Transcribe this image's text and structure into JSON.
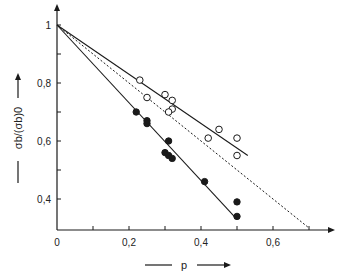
{
  "chart_data": {
    "type": "scatter",
    "title": "",
    "xlabel": "p",
    "ylabel": "σb/(σb)0",
    "xlim": [
      0,
      0.75
    ],
    "ylim": [
      0.3,
      1.05
    ],
    "x_ticks": [
      0,
      0.1,
      0.2,
      0.3,
      0.4,
      0.5,
      0.6,
      0.7
    ],
    "x_tick_labels": [
      {
        "value": 0,
        "label": "0"
      },
      {
        "value": 0.2,
        "label": "0,2"
      },
      {
        "value": 0.4,
        "label": "0,4"
      },
      {
        "value": 0.6,
        "label": "0,6"
      }
    ],
    "y_ticks": [
      0.4,
      0.5,
      0.6,
      0.7,
      0.8,
      0.9,
      1.0
    ],
    "y_tick_labels": [
      {
        "value": 1.0,
        "label": "1"
      },
      {
        "value": 0.8,
        "label": "0,8"
      },
      {
        "value": 0.6,
        "label": "0,6"
      },
      {
        "value": 0.4,
        "label": "0,4"
      }
    ],
    "grid": false,
    "legend": null,
    "series": [
      {
        "name": "open circles",
        "marker": "open-circle",
        "points": [
          [
            0.23,
            0.81
          ],
          [
            0.25,
            0.75
          ],
          [
            0.3,
            0.76
          ],
          [
            0.32,
            0.74
          ],
          [
            0.32,
            0.71
          ],
          [
            0.31,
            0.7
          ],
          [
            0.45,
            0.64
          ],
          [
            0.42,
            0.61
          ],
          [
            0.5,
            0.61
          ],
          [
            0.5,
            0.55
          ]
        ]
      },
      {
        "name": "filled circles",
        "marker": "filled-circle",
        "points": [
          [
            0.22,
            0.7
          ],
          [
            0.25,
            0.66
          ],
          [
            0.25,
            0.67
          ],
          [
            0.31,
            0.6
          ],
          [
            0.3,
            0.56
          ],
          [
            0.31,
            0.55
          ],
          [
            0.32,
            0.54
          ],
          [
            0.41,
            0.46
          ],
          [
            0.5,
            0.39
          ],
          [
            0.5,
            0.34
          ]
        ]
      }
    ],
    "lines": [
      {
        "name": "fit-open",
        "style": "solid",
        "from": [
          0,
          1.0
        ],
        "to": [
          0.53,
          0.55
        ]
      },
      {
        "name": "theory",
        "style": "dashed",
        "from": [
          0,
          1.0
        ],
        "to": [
          0.7,
          0.3
        ]
      },
      {
        "name": "fit-filled",
        "style": "solid",
        "from": [
          0,
          1.0
        ],
        "to": [
          0.5,
          0.33
        ]
      }
    ]
  },
  "colors": {
    "ink": "#1a1a1a",
    "background": "#ffffff"
  }
}
